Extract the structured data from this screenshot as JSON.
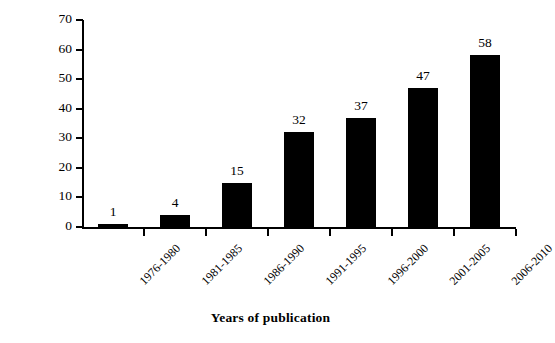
{
  "chart_data": {
    "type": "bar",
    "title": "",
    "xlabel": "Years of publication",
    "ylabel": "No. of articles",
    "categories": [
      "1976-1980",
      "1981-1985",
      "1986-1990",
      "1991-1995",
      "1996-2000",
      "2001-2005",
      "2006-2010"
    ],
    "values": [
      1,
      4,
      15,
      32,
      37,
      47,
      58
    ],
    "data_labels": [
      "1",
      "4",
      "15",
      "32",
      "37",
      "47",
      "58"
    ],
    "ylim": [
      0,
      70
    ],
    "ytick_values": [
      0,
      10,
      20,
      30,
      40,
      50,
      60,
      70
    ],
    "ytick_labels": [
      "0",
      "10",
      "20",
      "30",
      "40",
      "50",
      "60",
      "70"
    ],
    "grid": false,
    "legend": null,
    "legend_position": "none",
    "bar_color": "#000000",
    "axis_color": "#000000",
    "background_color": "#ffffff",
    "xtick_label_rotation_deg": 45
  }
}
